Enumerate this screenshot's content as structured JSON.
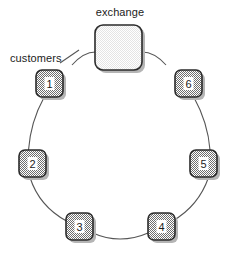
{
  "figure": {
    "kind": "ring-network-diagram",
    "width": 239,
    "height": 259,
    "background": "#ffffff"
  },
  "labels": {
    "exchange": "exchange",
    "customers": "customers"
  },
  "colors": {
    "node_fill": "#9a9a9a",
    "node_stroke": "#2b2b2b",
    "node_inner_fill": "#ffffff",
    "exchange_fill": "#f0f0f0",
    "exchange_stroke": "#2b2b2b",
    "link_stroke": "#555555",
    "text": "#1c1c1c",
    "shadow": "#b5b5b5"
  },
  "exchange_node": {
    "id": "exchange",
    "label": "exchange",
    "x": 95,
    "y": 25,
    "width": 47,
    "height": 45,
    "radius": 8
  },
  "customer_nodes": [
    {
      "id": "1",
      "label": "1",
      "x": 36,
      "y": 70,
      "width": 27,
      "height": 27,
      "radius": 6,
      "angle_deg": 240
    },
    {
      "id": "2",
      "label": "2",
      "x": 19,
      "y": 150,
      "width": 27,
      "height": 27,
      "radius": 6,
      "angle_deg": 180
    },
    {
      "id": "3",
      "label": "3",
      "x": 66,
      "y": 213,
      "width": 27,
      "height": 27,
      "radius": 6,
      "angle_deg": 120
    },
    {
      "id": "4",
      "label": "4",
      "x": 148,
      "y": 213,
      "width": 27,
      "height": 27,
      "radius": 6,
      "angle_deg": 60
    },
    {
      "id": "5",
      "label": "5",
      "x": 190,
      "y": 150,
      "width": 27,
      "height": 27,
      "radius": 6,
      "angle_deg": 0
    },
    {
      "id": "6",
      "label": "6",
      "x": 175,
      "y": 70,
      "width": 27,
      "height": 27,
      "radius": 6,
      "angle_deg": 300
    }
  ],
  "links": [
    {
      "from": "exchange",
      "to": "1"
    },
    {
      "from": "1",
      "to": "2"
    },
    {
      "from": "2",
      "to": "3"
    },
    {
      "from": "3",
      "to": "4"
    },
    {
      "from": "4",
      "to": "5"
    },
    {
      "from": "5",
      "to": "6"
    },
    {
      "from": "6",
      "to": "exchange"
    }
  ],
  "leader_line": {
    "from_label": "customers",
    "to_node": "1",
    "x1": 60,
    "y1": 63,
    "x2": 79,
    "y2": 50
  }
}
